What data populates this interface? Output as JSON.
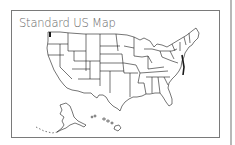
{
  "card": {
    "title": "Standard US Map"
  },
  "map": {
    "region": "United States",
    "style": "state outlines",
    "insets": [
      "Alaska",
      "Hawaii"
    ],
    "stroke_color": "#1a1a1a",
    "fill_color": "#ffffff"
  },
  "colors": {
    "frame_border": "#7a7a7a",
    "title_text": "#6a6a6a",
    "scrollbar": "#b8b8b8"
  }
}
